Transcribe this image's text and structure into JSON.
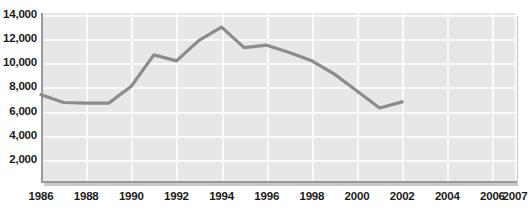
{
  "chart_data": {
    "type": "line",
    "title": "",
    "subtitle": "",
    "xlabel": "",
    "ylabel": "",
    "grid": true,
    "legend": false,
    "legend_position": "none",
    "line_color": "#8c8c8c",
    "plot_background": "#e7e7e7",
    "gridline_color": "#fafafa",
    "axis_color": "#9a9a9a",
    "text_color": "#1a1a1a",
    "xlim": [
      1986,
      2007
    ],
    "ylim": [
      0,
      14000
    ],
    "ytick_values": [
      2000,
      4000,
      6000,
      8000,
      10000,
      12000,
      14000
    ],
    "ytick_labels": [
      "2,000",
      "4,000",
      "6,000",
      "8,000",
      "10,000",
      "12,000",
      "14,000"
    ],
    "xtick_values": [
      1986,
      1988,
      1990,
      1992,
      1994,
      1996,
      1998,
      2000,
      2002,
      2004,
      2006,
      2007
    ],
    "xtick_labels": [
      "1986",
      "1988",
      "1990",
      "1992",
      "1994",
      "1996",
      "1998",
      "2000",
      "2002",
      "2004",
      "2006",
      "2007"
    ],
    "x": [
      1986,
      1987,
      1988,
      1989,
      1990,
      1991,
      1992,
      1993,
      1994,
      1995,
      1996,
      1997,
      1998,
      1999,
      2000,
      2001,
      2002
    ],
    "values": [
      7400,
      6750,
      6700,
      6700,
      8100,
      10700,
      10200,
      11900,
      13000,
      11300,
      11500,
      10900,
      10200,
      9100,
      7700,
      6300,
      6800
    ],
    "series": [
      {
        "name": "series-1",
        "values": [
          7400,
          6750,
          6700,
          6700,
          8100,
          10700,
          10200,
          11900,
          13000,
          11300,
          11500,
          10900,
          10200,
          9100,
          7700,
          6300,
          6800
        ]
      }
    ]
  }
}
